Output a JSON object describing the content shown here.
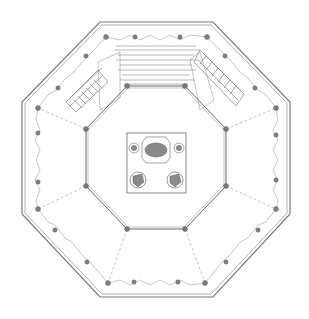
{
  "drawing": {
    "type": "octagonal stage floor plan",
    "title_block_text": "",
    "colors": {
      "line": "#6a6a6a",
      "line_light": "#9a9a9a",
      "fill_dark": "#7a7a7a",
      "fill_mid": "#b8b8b8",
      "background": "#ffffff"
    },
    "outer_octagon": [
      [
        100,
        22
      ],
      [
        213,
        22
      ],
      [
        290,
        102
      ],
      [
        290,
        214
      ],
      [
        213,
        297
      ],
      [
        100,
        297
      ],
      [
        22,
        214
      ],
      [
        22,
        102
      ]
    ],
    "inner_octagon": [
      [
        127,
        86
      ],
      [
        185,
        86
      ],
      [
        226,
        129
      ],
      [
        226,
        186
      ],
      [
        185,
        229
      ],
      [
        127,
        229
      ],
      [
        86,
        186
      ],
      [
        86,
        129
      ]
    ],
    "center_box": {
      "x": 127,
      "y": 133,
      "w": 59,
      "h": 60
    },
    "center_elements": [
      {
        "name": "top-large-fixture",
        "cx": 156,
        "cy": 150,
        "r": 11
      },
      {
        "name": "left-small-fixture",
        "cx": 134,
        "cy": 148,
        "r": 5
      },
      {
        "name": "right-small-fixture",
        "cx": 179,
        "cy": 148,
        "r": 5
      },
      {
        "name": "bottom-left-fixture",
        "cx": 138,
        "cy": 180,
        "r": 8
      },
      {
        "name": "bottom-right-fixture",
        "cx": 175,
        "cy": 180,
        "r": 8
      }
    ],
    "staircases": [
      {
        "name": "left-stair",
        "x1": 60,
        "y1": 100,
        "x2": 100,
        "y2": 80
      },
      {
        "name": "right-stair",
        "x1": 210,
        "y1": 80,
        "x2": 250,
        "y2": 100
      }
    ]
  }
}
